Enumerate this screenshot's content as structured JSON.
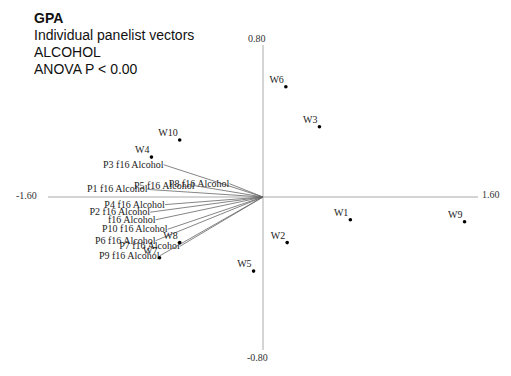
{
  "chart_data": {
    "type": "scatter",
    "title": "GPA",
    "subtitle_lines": [
      "Individual panelist vectors",
      "ALCOHOL",
      "ANOVA P < 0.00"
    ],
    "xlim": [
      -1.6,
      1.6
    ],
    "ylim": [
      -0.8,
      0.8
    ],
    "x_tick_labels": [
      "-1.60",
      "1.60"
    ],
    "y_tick_labels": [
      "0.80",
      "-0.80"
    ],
    "grid": false,
    "points": [
      {
        "label": "W6",
        "x": 0.17,
        "y": 0.58
      },
      {
        "label": "W3",
        "x": 0.42,
        "y": 0.37
      },
      {
        "label": "W10",
        "x": -0.62,
        "y": 0.3
      },
      {
        "label": "W4",
        "x": -0.83,
        "y": 0.21
      },
      {
        "label": "W1",
        "x": 0.65,
        "y": -0.12
      },
      {
        "label": "W9",
        "x": 1.5,
        "y": -0.13
      },
      {
        "label": "W2",
        "x": 0.18,
        "y": -0.24
      },
      {
        "label": "W8",
        "x": -0.62,
        "y": -0.24
      },
      {
        "label": "W7",
        "x": -0.77,
        "y": -0.32
      },
      {
        "label": "W5",
        "x": -0.07,
        "y": -0.39
      }
    ],
    "vectors": [
      {
        "label": "P3 f16 Alcohol",
        "x": -0.74,
        "y": 0.17
      },
      {
        "label": "P8 f16 Alcohol",
        "x": -0.25,
        "y": 0.07
      },
      {
        "label": "P5 f16 Alcohol",
        "x": -0.51,
        "y": 0.06
      },
      {
        "label": "P1 f16 Alcohol",
        "x": -0.86,
        "y": 0.04
      },
      {
        "label": "P4 f16 Alcohol",
        "x": -0.73,
        "y": -0.04
      },
      {
        "label": "P2 f16 Alcohol",
        "x": -0.84,
        "y": -0.08
      },
      {
        "label": "f16 Alcohol",
        "x": -0.8,
        "y": -0.12
      },
      {
        "label": "P10 f16 Alcohol",
        "x": -0.71,
        "y": -0.17
      },
      {
        "label": "P6 f16 Alcohol",
        "x": -0.8,
        "y": -0.23
      },
      {
        "label": "P7 f16 Alcohol",
        "x": -0.62,
        "y": -0.26
      },
      {
        "label": "P9 f16 Alcohol",
        "x": -0.77,
        "y": -0.31
      }
    ]
  },
  "header": {
    "title": "GPA",
    "line1": "Individual panelist vectors",
    "line2": "ALCOHOL",
    "line3": "ANOVA P < 0.00"
  },
  "axes": {
    "x_min_label": "-1.60",
    "x_max_label": "1.60",
    "y_max_label": "0.80",
    "y_min_label": "-0.80"
  }
}
